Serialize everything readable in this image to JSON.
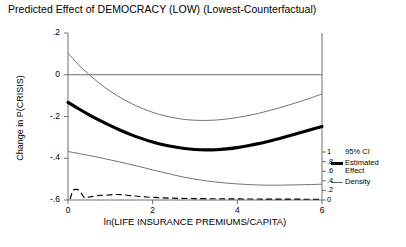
{
  "chart_data": {
    "type": "line",
    "title": "Predicted Effect of DEMOCRACY (LOW) (Lowest-Counterfactual)",
    "xlabel": "ln(LIFE INSURANCE PREMIUMS/CAPITA)",
    "ylabel": "Change in P(CRISIS)",
    "xlim": [
      0,
      6
    ],
    "ylim": [
      -0.6,
      0.2
    ],
    "xticks": [
      "0",
      "2",
      "4",
      "6"
    ],
    "xtick_values": [
      0,
      2,
      4,
      6
    ],
    "yticks": [
      ".2",
      "0",
      "-.2",
      "-.4",
      "-.6"
    ],
    "ytick_values": [
      0.2,
      0,
      -0.2,
      -0.4,
      -0.6
    ],
    "secondary_ylabel": "Density",
    "secondary_ylim": [
      0,
      1
    ],
    "secondary_yticks": [
      "1",
      ".8",
      ".6",
      ".4",
      ".2",
      "0"
    ],
    "secondary_ytick_values": [
      1,
      0.8,
      0.6,
      0.4,
      0.2,
      0
    ],
    "grid": false,
    "zero_reference_line": 0,
    "legend_position": "right",
    "x": [
      0,
      0.25,
      0.5,
      0.75,
      1,
      1.25,
      1.5,
      1.75,
      2,
      2.25,
      2.5,
      2.75,
      3,
      3.25,
      3.5,
      3.75,
      4,
      4.25,
      4.5,
      4.75,
      5,
      5.25,
      5.5,
      5.75,
      6
    ],
    "series": [
      {
        "name": "Estimated Effect",
        "style": "solid-thick",
        "color": "#000000",
        "values": [
          -0.132,
          -0.163,
          -0.192,
          -0.219,
          -0.244,
          -0.267,
          -0.288,
          -0.306,
          -0.322,
          -0.335,
          -0.345,
          -0.353,
          -0.358,
          -0.36,
          -0.359,
          -0.355,
          -0.349,
          -0.34,
          -0.33,
          -0.318,
          -0.305,
          -0.291,
          -0.277,
          -0.262,
          -0.248
        ]
      },
      {
        "name": "95% CI Upper",
        "style": "solid-thin",
        "color": "#636363",
        "values": [
          0.103,
          0.048,
          0.0,
          -0.042,
          -0.079,
          -0.111,
          -0.138,
          -0.161,
          -0.18,
          -0.195,
          -0.206,
          -0.214,
          -0.218,
          -0.219,
          -0.217,
          -0.212,
          -0.205,
          -0.196,
          -0.185,
          -0.172,
          -0.158,
          -0.143,
          -0.127,
          -0.11,
          -0.092
        ]
      },
      {
        "name": "95% CI Lower",
        "style": "solid-thin",
        "color": "#636363",
        "values": [
          -0.368,
          -0.377,
          -0.387,
          -0.397,
          -0.408,
          -0.419,
          -0.431,
          -0.443,
          -0.456,
          -0.468,
          -0.48,
          -0.491,
          -0.5,
          -0.508,
          -0.514,
          -0.519,
          -0.523,
          -0.526,
          -0.528,
          -0.529,
          -0.529,
          -0.528,
          -0.527,
          -0.526,
          -0.524
        ]
      },
      {
        "name": "Density",
        "style": "dashed",
        "color": "#000000",
        "axis": "secondary",
        "x": [
          0.05,
          0.12,
          0.2,
          0.28,
          0.34,
          0.4,
          0.47,
          0.55,
          0.65,
          0.75,
          0.85,
          0.95,
          1.05,
          1.15,
          1.25,
          1.4,
          1.55,
          1.7,
          1.85,
          2.0,
          2.2,
          2.4,
          2.6,
          2.8,
          3.0,
          3.3,
          3.6,
          3.9,
          4.2,
          4.5,
          4.8,
          5.1,
          5.4,
          5.7,
          6.0
        ],
        "values": [
          0.02,
          0.2,
          0.22,
          0.19,
          0.1,
          0.045,
          0.055,
          0.07,
          0.085,
          0.095,
          0.1,
          0.105,
          0.112,
          0.115,
          0.112,
          0.1,
          0.085,
          0.072,
          0.062,
          0.055,
          0.046,
          0.04,
          0.035,
          0.032,
          0.03,
          0.027,
          0.025,
          0.023,
          0.021,
          0.02,
          0.019,
          0.018,
          0.017,
          0.016,
          0.015
        ]
      }
    ],
    "legend": [
      {
        "label": "95% CI",
        "style": "solid-thin"
      },
      {
        "label": "Estimated",
        "label2": "Effect",
        "style": "solid-thick"
      },
      {
        "label": "Density",
        "style": "dashed"
      }
    ]
  }
}
